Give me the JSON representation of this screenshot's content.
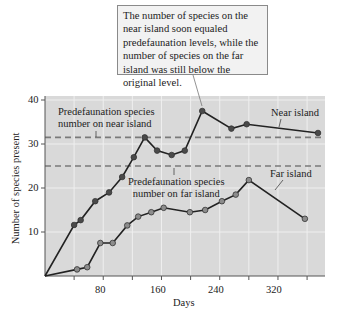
{
  "callout": {
    "text": "The number of species on the near island soon equaled predefaunation levels, while the number of species on the far island was still below the original level."
  },
  "labels": {
    "near_predef": "Predefaunation species number on near island",
    "near_predef_l1": "Predefaunation species",
    "near_predef_l2": "number on near island",
    "far_predef_l1": "Predefaunation species",
    "far_predef_l2": "number on far island",
    "near_series": "Near island",
    "far_series": "Far island"
  },
  "axes": {
    "xlabel": "Days",
    "ylabel": "Number of species present",
    "xticks": [
      "80",
      "160",
      "240",
      "320"
    ],
    "yticks": [
      "10",
      "20",
      "30",
      "40"
    ]
  },
  "colors": {
    "plot_bg": "#d9d9d9",
    "grid": "#efefef",
    "line": "#222222",
    "marker_near": "#4a4a4a",
    "marker_far": "#8c8c8c",
    "dashed": "#7a7a7a"
  },
  "chart_data": {
    "type": "line",
    "title": "",
    "xlabel": "Days",
    "ylabel": "Number of species present",
    "xlim": [
      0,
      400
    ],
    "ylim": [
      0,
      40
    ],
    "x_tick_labels": [
      "80",
      "160",
      "240",
      "320"
    ],
    "y_tick_labels": [
      "10",
      "20",
      "30",
      "40"
    ],
    "grid": true,
    "series": [
      {
        "name": "Near island",
        "x": [
          0,
          40,
          49,
          69,
          88,
          106,
          122,
          137,
          154,
          174,
          192,
          216,
          256,
          277,
          375
        ],
        "y": [
          0,
          11.6,
          12.7,
          17,
          19,
          22.5,
          27,
          31.5,
          28.5,
          27.5,
          28.5,
          37.5,
          33.5,
          34.5,
          32.5
        ]
      },
      {
        "name": "Far island",
        "x": [
          0,
          44,
          58,
          76,
          93,
          113,
          128,
          146,
          163,
          199,
          220,
          243,
          262,
          280,
          357
        ],
        "y": [
          0,
          1.5,
          2,
          7.5,
          7.5,
          11.5,
          13.5,
          14.5,
          15.5,
          14.5,
          15,
          17,
          18.5,
          21.8,
          13
        ]
      }
    ],
    "reference_lines": [
      {
        "name": "Predefaunation species number on near island",
        "y": 31.5,
        "style": "dashed"
      },
      {
        "name": "Predefaunation species number on far island",
        "y": 25,
        "style": "dashed"
      }
    ],
    "annotations": [
      {
        "text": "The number of species on the near island soon equaled predefaunation levels, while the number of species on the far island was still below the original level.",
        "points_to": {
          "x": 216,
          "y": 37.5
        }
      },
      {
        "text": "Near island",
        "series": "Near island"
      },
      {
        "text": "Far island",
        "series": "Far island"
      }
    ]
  }
}
